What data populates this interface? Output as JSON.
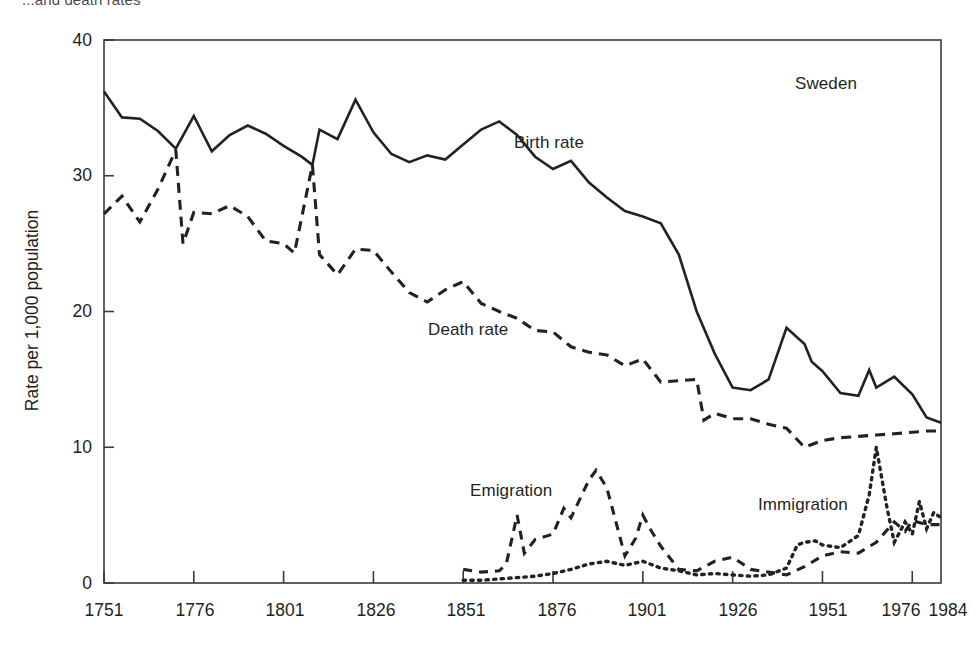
{
  "figure": {
    "cut_title": "...and death rates",
    "region_label": "Sweden"
  },
  "axes": {
    "ylabel": "Rate per 1,000 population",
    "yticks": [
      "0",
      "10",
      "20",
      "30",
      "40"
    ],
    "xticks": [
      "1751",
      "1776",
      "1801",
      "1826",
      "1851",
      "1876",
      "1901",
      "1926",
      "1951",
      "1976",
      "1984"
    ]
  },
  "annotations": {
    "birth": "Birth rate",
    "death": "Death rate",
    "emigration": "Emigration",
    "immigration": "Immigration"
  },
  "colors": {
    "line": "#222222",
    "axis": "#3a3a3a",
    "background": "#ffffff"
  },
  "chart_data": {
    "type": "line",
    "title": "...and death rates",
    "subtitle": "Sweden",
    "xlabel": "",
    "ylabel": "Rate per 1,000 population",
    "xlim": [
      1751,
      1984
    ],
    "ylim": [
      0,
      40
    ],
    "grid": false,
    "legend": "inline-annotations",
    "xticks": [
      1751,
      1776,
      1801,
      1826,
      1851,
      1876,
      1901,
      1926,
      1951,
      1976,
      1984
    ],
    "yticks": [
      0,
      10,
      20,
      30,
      40
    ],
    "series": [
      {
        "name": "Birth rate",
        "style": "solid",
        "x": [
          1751,
          1756,
          1761,
          1766,
          1771,
          1776,
          1781,
          1786,
          1791,
          1796,
          1801,
          1806,
          1809,
          1811,
          1816,
          1821,
          1826,
          1831,
          1836,
          1841,
          1846,
          1851,
          1856,
          1861,
          1866,
          1871,
          1876,
          1881,
          1886,
          1891,
          1896,
          1901,
          1906,
          1911,
          1916,
          1921,
          1926,
          1931,
          1936,
          1941,
          1946,
          1948,
          1951,
          1956,
          1961,
          1964,
          1966,
          1971,
          1976,
          1980,
          1984
        ],
        "values": [
          36.2,
          34.3,
          34.2,
          33.3,
          32.0,
          34.4,
          31.8,
          33.0,
          33.7,
          33.1,
          32.2,
          31.4,
          30.8,
          33.4,
          32.7,
          35.6,
          33.2,
          31.6,
          31.0,
          31.5,
          31.2,
          32.3,
          33.4,
          34.0,
          33.0,
          31.4,
          30.5,
          31.1,
          29.5,
          28.4,
          27.4,
          27.0,
          26.5,
          24.2,
          20.0,
          16.9,
          14.4,
          14.2,
          15.0,
          18.8,
          17.6,
          16.3,
          15.6,
          14.0,
          13.8,
          15.7,
          14.4,
          15.2,
          13.9,
          12.2,
          11.8
        ]
      },
      {
        "name": "Death rate",
        "style": "dashed",
        "x": [
          1751,
          1756,
          1761,
          1766,
          1771,
          1773,
          1776,
          1781,
          1786,
          1791,
          1796,
          1801,
          1804,
          1809,
          1811,
          1816,
          1821,
          1826,
          1831,
          1836,
          1841,
          1846,
          1851,
          1856,
          1861,
          1866,
          1871,
          1876,
          1881,
          1886,
          1891,
          1896,
          1901,
          1906,
          1911,
          1916,
          1918,
          1921,
          1926,
          1931,
          1936,
          1941,
          1946,
          1951,
          1956,
          1961,
          1966,
          1971,
          1976,
          1980,
          1984
        ],
        "values": [
          27.2,
          28.5,
          26.6,
          29.0,
          31.9,
          25.0,
          27.3,
          27.2,
          27.8,
          27.0,
          25.2,
          25.0,
          24.3,
          30.8,
          24.2,
          22.7,
          24.6,
          24.5,
          22.9,
          21.4,
          20.7,
          21.6,
          22.2,
          20.6,
          20.0,
          19.5,
          18.6,
          18.5,
          17.4,
          17.0,
          16.8,
          16.0,
          16.5,
          14.8,
          14.9,
          15.0,
          12.0,
          12.5,
          12.1,
          12.1,
          11.7,
          11.4,
          10.0,
          10.5,
          10.7,
          10.8,
          10.9,
          11.0,
          11.1,
          11.2,
          11.2
        ]
      },
      {
        "name": "Emigration",
        "style": "dashed",
        "x": [
          1851,
          1856,
          1861,
          1863,
          1866,
          1868,
          1871,
          1876,
          1879,
          1881,
          1886,
          1888,
          1891,
          1893,
          1896,
          1899,
          1901,
          1903,
          1906,
          1911,
          1916,
          1921,
          1926,
          1931,
          1936,
          1941,
          1946,
          1951,
          1956,
          1961,
          1966,
          1971,
          1974,
          1976,
          1980,
          1984
        ],
        "values": [
          1.0,
          0.8,
          0.9,
          1.4,
          5.0,
          2.2,
          3.2,
          3.6,
          5.5,
          4.8,
          7.6,
          8.3,
          7.0,
          5.0,
          2.0,
          3.3,
          5.0,
          4.0,
          2.7,
          1.0,
          0.9,
          1.6,
          1.9,
          1.0,
          0.8,
          0.6,
          1.2,
          2.0,
          2.3,
          2.2,
          3.0,
          4.5,
          3.8,
          4.6,
          4.3,
          4.3
        ]
      },
      {
        "name": "Immigration",
        "style": "dotted",
        "x": [
          1851,
          1856,
          1861,
          1866,
          1871,
          1876,
          1881,
          1886,
          1891,
          1896,
          1901,
          1906,
          1911,
          1916,
          1921,
          1926,
          1931,
          1936,
          1941,
          1944,
          1946,
          1949,
          1951,
          1956,
          1961,
          1964,
          1966,
          1969,
          1971,
          1974,
          1976,
          1978,
          1980,
          1982,
          1984
        ],
        "values": [
          0.2,
          0.2,
          0.3,
          0.4,
          0.5,
          0.7,
          1.0,
          1.4,
          1.6,
          1.3,
          1.6,
          1.1,
          0.9,
          0.6,
          0.7,
          0.6,
          0.5,
          0.6,
          1.1,
          2.8,
          3.0,
          3.1,
          2.8,
          2.6,
          3.5,
          6.5,
          10.0,
          5.5,
          3.0,
          4.5,
          3.6,
          6.0,
          4.0,
          5.2,
          4.8
        ]
      }
    ]
  }
}
